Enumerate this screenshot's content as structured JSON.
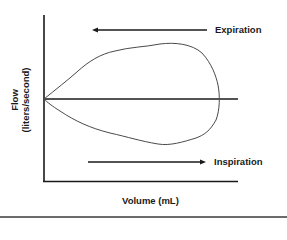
{
  "diagram": {
    "y_axis": {
      "label_line1": "Flow",
      "label_line2": "(liters/second)"
    },
    "x_axis": {
      "label": "Volume (mL)"
    },
    "annotations": {
      "expiration": {
        "label": "Expiration",
        "direction": "left"
      },
      "inspiration": {
        "label": "Inspiration",
        "direction": "right"
      }
    },
    "colors": {
      "axis": "#1a1a1a",
      "loop": "#4a4a4a",
      "text": "#1a1a1a",
      "bottom_rule": "#6b6b6b"
    }
  }
}
